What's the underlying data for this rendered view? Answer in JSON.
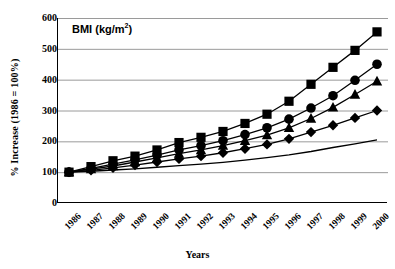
{
  "chart_data": {
    "type": "line",
    "title": "BMI (kg/m2)",
    "title_base": "BMI (kg/m",
    "title_sup": "2",
    "title_tail": ")",
    "xlabel": "Years",
    "ylabel": "% Increase (1986 = 100%)",
    "grid": true,
    "legend": "none",
    "ylim": [
      0,
      600
    ],
    "yticks": [
      600,
      500,
      400,
      300,
      200,
      100,
      0
    ],
    "categories": [
      "1986",
      "1987",
      "1988",
      "1989",
      "1990",
      "1991",
      "1992",
      "1993",
      "1994",
      "1995",
      "1996",
      "1997",
      "1998",
      "1999",
      "2000"
    ],
    "series": [
      {
        "name": "series-square",
        "marker": "square",
        "values": [
          100,
          118,
          137,
          152,
          172,
          196,
          213,
          232,
          258,
          288,
          330,
          385,
          440,
          495,
          555
        ]
      },
      {
        "name": "series-circle",
        "marker": "circle",
        "values": [
          100,
          112,
          126,
          140,
          155,
          172,
          186,
          202,
          222,
          244,
          272,
          308,
          348,
          398,
          450
        ]
      },
      {
        "name": "series-triangle",
        "marker": "triangle",
        "values": [
          100,
          110,
          120,
          133,
          146,
          160,
          172,
          186,
          202,
          220,
          244,
          274,
          310,
          352,
          395
        ]
      },
      {
        "name": "series-diamond",
        "marker": "diamond",
        "values": [
          100,
          106,
          114,
          123,
          133,
          143,
          152,
          163,
          176,
          190,
          208,
          230,
          252,
          276,
          300
        ]
      },
      {
        "name": "series-plain-line",
        "marker": "none",
        "values": [
          100,
          103,
          107,
          111,
          116,
          121,
          126,
          132,
          139,
          147,
          156,
          167,
          180,
          192,
          205
        ]
      }
    ],
    "colors": {
      "line": "#000000",
      "marker": "#000000",
      "grid": "#9a9a9a",
      "axis": "#000000",
      "background": "#ffffff"
    }
  }
}
